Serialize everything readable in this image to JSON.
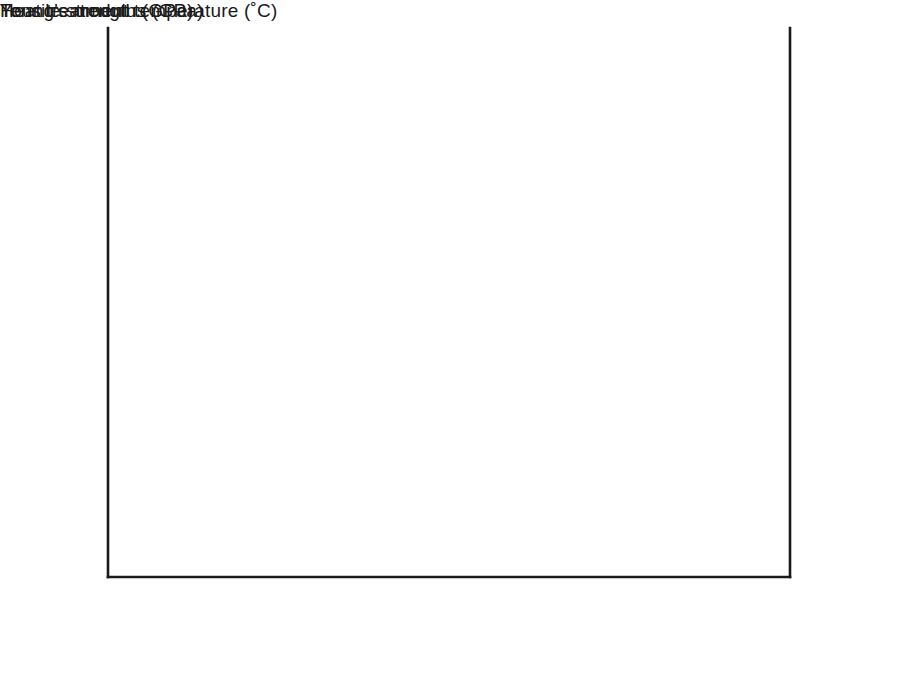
{
  "chart_data": {
    "type": "line",
    "title": "",
    "xlabel": "Heat treatment temperature   (˚C)",
    "xlabel_main": "Heat treatment temperature",
    "xlabel_units": "(˚C)",
    "ylabel_left": "Tensile strength   (GPa)",
    "ylabel_right": "Young's modulus  (GPa)",
    "xlim": [
      1150,
      2700
    ],
    "xticks": [
      1200,
      1400,
      1600,
      1800,
      2000,
      2200,
      2400,
      2600
    ],
    "xtick_labels": [
      "1200",
      "1400",
      "1600",
      "1800",
      "2000",
      "2200",
      "2400",
      "2600"
    ],
    "ylim_left": [
      0,
      4.4
    ],
    "yticks_left": [
      0,
      1,
      2,
      3,
      4
    ],
    "ytick_labels_left": [
      "0",
      "1",
      "2",
      "3",
      "4"
    ],
    "ylim_right": [
      0,
      440
    ],
    "yticks_right": [
      0,
      100,
      200,
      300,
      400
    ],
    "ytick_labels_right": [
      "0",
      "100",
      "200",
      "300",
      "400"
    ],
    "grid": false,
    "legend": "inline-annotations",
    "line_color": "#1a1a1a",
    "series": [
      {
        "name": "Strength",
        "axis": "left",
        "units": "GPa",
        "label_text": "Strength",
        "label_x": 2200,
        "label_y": 2.62,
        "x": [
          1200,
          1250,
          1300,
          1350,
          1400,
          1450,
          1500,
          1550,
          1600,
          1650,
          1700,
          1750,
          1800,
          1850,
          1900,
          1950,
          2000,
          2100,
          2200,
          2300,
          2400,
          2500,
          2600
        ],
        "y": [
          2.14,
          2.22,
          2.38,
          2.62,
          2.86,
          3.05,
          3.14,
          3.17,
          3.12,
          2.98,
          2.82,
          2.69,
          2.57,
          2.48,
          2.44,
          2.42,
          2.41,
          2.4,
          2.39,
          2.38,
          2.37,
          2.36,
          2.35
        ]
      },
      {
        "name": "Young's modulus",
        "axis": "right",
        "units": "GPa",
        "label_text": "Young's modulus",
        "label_x": 1840,
        "label_y": 388,
        "x": [
          1200,
          1300,
          1400,
          1500,
          1600,
          1700,
          1800,
          1900,
          2000,
          2100,
          2200,
          2300,
          2400,
          2500
        ],
        "y": [
          158,
          196,
          221,
          236,
          248,
          260,
          272,
          287,
          303,
          321,
          341,
          362,
          384,
          406
        ]
      }
    ]
  },
  "page_bleed": {
    "lines": [
      "ÌÍÎÏ ÐÑ ÒÓÔÕÖ×Ø ÙÚÛÜÝÞß àáâãä åæçè",
      "éêëì íîïðñ òóôõö÷ øùú ûüýþÿ ĀāĂă ĄąĆć",
      "ĈĉĊċ ČčĎď ĐđĒē ĔĕĖė ĘęĚě ĜĝĞğ ĠġĢģ"
    ]
  }
}
